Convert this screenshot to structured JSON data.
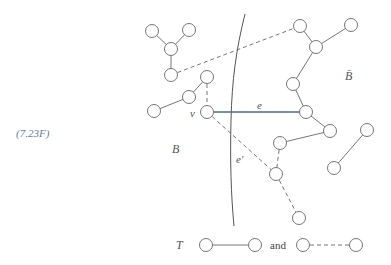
{
  "figure": {
    "label": "(7.23F)",
    "label_color": "#5a7fb0"
  },
  "regions": {
    "left": "B",
    "right": "B̄"
  },
  "edge_labels": {
    "e": "e",
    "e_prime": "e′",
    "v": "v"
  },
  "legend": {
    "tree_symbol": "T",
    "conjunction": "and"
  },
  "colors": {
    "node_stroke": "#666666",
    "tree_edge": "#666666",
    "dashed_edge": "#666666",
    "highlight_edge": "#4a6a9a",
    "boundary": "#555555"
  },
  "nodes": [
    {
      "id": "a1",
      "x": 152,
      "y": 31
    },
    {
      "id": "a2",
      "x": 189,
      "y": 30
    },
    {
      "id": "a3",
      "x": 171,
      "y": 49
    },
    {
      "id": "a4",
      "x": 171,
      "y": 75
    },
    {
      "id": "b1",
      "x": 207,
      "y": 77
    },
    {
      "id": "b2",
      "x": 189,
      "y": 97
    },
    {
      "id": "b3",
      "x": 154,
      "y": 111
    },
    {
      "id": "v",
      "x": 207,
      "y": 112
    },
    {
      "id": "r1",
      "x": 300,
      "y": 26
    },
    {
      "id": "r2",
      "x": 351,
      "y": 25
    },
    {
      "id": "r3",
      "x": 316,
      "y": 47
    },
    {
      "id": "r4",
      "x": 293,
      "y": 84
    },
    {
      "id": "r5",
      "x": 306,
      "y": 112
    },
    {
      "id": "r6",
      "x": 330,
      "y": 131
    },
    {
      "id": "r7",
      "x": 280,
      "y": 143
    },
    {
      "id": "r8",
      "x": 276,
      "y": 174
    },
    {
      "id": "r9",
      "x": 299,
      "y": 218
    },
    {
      "id": "s1",
      "x": 367,
      "y": 130
    },
    {
      "id": "s2",
      "x": 334,
      "y": 168
    }
  ]
}
